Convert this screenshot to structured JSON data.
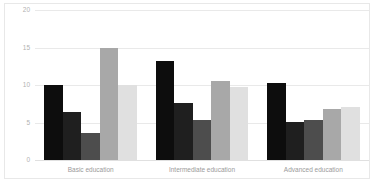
{
  "chart_data": {
    "type": "bar",
    "title": "",
    "xlabel": "",
    "ylabel": "",
    "ylim": [
      0,
      20
    ],
    "yticks": [
      0,
      5,
      10,
      15,
      20
    ],
    "grid": true,
    "legend": "none",
    "categories": [
      "Basic education",
      "Intermediate education",
      "Advanced education"
    ],
    "series": [
      {
        "name": "Series 1",
        "color": "#0d0d0d",
        "values": [
          10.0,
          13.2,
          10.3
        ]
      },
      {
        "name": "Series 2",
        "color": "#1f1f1f",
        "values": [
          6.4,
          7.6,
          5.1
        ]
      },
      {
        "name": "Series 3",
        "color": "#4d4d4d",
        "values": [
          3.6,
          5.4,
          5.3
        ]
      },
      {
        "name": "Series 4",
        "color": "#a8a8a8",
        "values": [
          15.0,
          10.5,
          6.8
        ]
      },
      {
        "name": "Series 5",
        "color": "#e0e0e0",
        "values": [
          10.0,
          9.7,
          7.1
        ]
      }
    ]
  },
  "axis": {
    "tick_0": "0",
    "tick_5": "5",
    "tick_10": "10",
    "tick_15": "15",
    "tick_20": "20"
  },
  "labels": {
    "group_0": "Basic education",
    "group_1": "Intermediate education",
    "group_2": "Advanced education"
  }
}
